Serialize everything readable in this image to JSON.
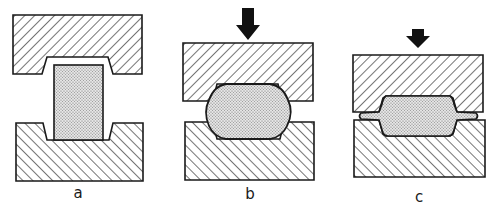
{
  "figure": {
    "colors": {
      "background": "#ffffff",
      "outline": "#1a1a1a",
      "hatch": "#2a2a2a",
      "workpiece_fill": "#d9d9d9",
      "stipple": "#6e6e6e"
    },
    "panels": [
      {
        "id": "a",
        "label": "a",
        "stage": "billet placed between open dies",
        "has_force_arrow": false
      },
      {
        "id": "b",
        "label": "b",
        "stage": "dies closing, billet deforming into cavity",
        "has_force_arrow": true
      },
      {
        "id": "c",
        "label": "c",
        "stage": "dies closed, flash formed at parting line",
        "has_force_arrow": true
      }
    ]
  }
}
